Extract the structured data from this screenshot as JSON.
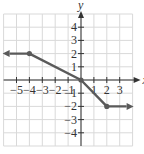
{
  "chart_data": {
    "type": "line",
    "title": "",
    "xlabel": "x",
    "ylabel": "y",
    "xlim": [
      -6,
      4
    ],
    "ylim": [
      -5,
      5
    ],
    "grid": true,
    "x_ticks": [
      "-5",
      "-4",
      "-3",
      "-2",
      "-1",
      "1",
      "2",
      "3"
    ],
    "y_ticks": [
      "4",
      "3",
      "2",
      "1",
      "-1",
      "-2",
      "-3",
      "-4"
    ],
    "series": [
      {
        "name": "piecewise",
        "points": [
          [
            -6,
            2
          ],
          [
            -4,
            2
          ],
          [
            0,
            0
          ],
          [
            2,
            -2
          ],
          [
            4,
            -2
          ]
        ],
        "marked_points": [
          [
            -4,
            2
          ],
          [
            0,
            0
          ],
          [
            2,
            -2
          ]
        ],
        "left_arrow": true,
        "right_arrow": true
      }
    ]
  },
  "colors": {
    "grid": "#d9d9d9",
    "axis": "#333333",
    "curve": "#5a5a5a"
  }
}
